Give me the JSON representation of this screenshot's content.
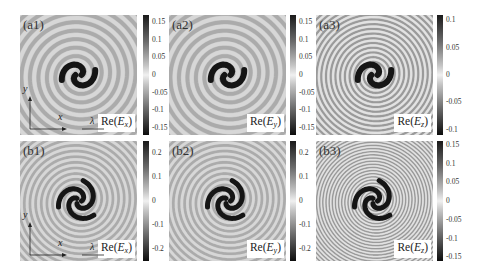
{
  "figure": {
    "panels": [
      {
        "id": "a1",
        "label": "(a1)",
        "quantity": "Re(",
        "field": "E",
        "component": "x",
        "close": ")",
        "row": 0,
        "col": 0,
        "arms": 2,
        "turns": 5,
        "contrast": 0.35,
        "colorbar": {
          "ticks": [
            "0.15",
            "0.1",
            "0.05",
            "0",
            "-0.05",
            "-0.1",
            "-0.15"
          ],
          "range": [
            -0.17,
            0.17
          ]
        }
      },
      {
        "id": "a2",
        "label": "(a2)",
        "quantity": "Re(",
        "field": "E",
        "component": "y",
        "close": ")",
        "row": 0,
        "col": 1,
        "arms": 2,
        "turns": 5,
        "contrast": 0.35,
        "colorbar": {
          "ticks": [
            "0.15",
            "0.1",
            "0.05",
            "0",
            "-0.05",
            "-0.1",
            "-0.15"
          ],
          "range": [
            -0.17,
            0.17
          ]
        }
      },
      {
        "id": "a3",
        "label": "(a3)",
        "quantity": "Re(",
        "field": "E",
        "component": "z",
        "close": ")",
        "row": 0,
        "col": 2,
        "arms": 2,
        "turns": 9,
        "contrast": 0.8,
        "colorbar": {
          "ticks": [
            "0.1",
            "0.05",
            "0",
            "-0.05",
            "-0.1"
          ],
          "range": [
            -0.11,
            0.11
          ]
        }
      },
      {
        "id": "b1",
        "label": "(b1)",
        "quantity": "Re(",
        "field": "E",
        "component": "x",
        "close": ")",
        "row": 1,
        "col": 0,
        "arms": 3,
        "turns": 5,
        "contrast": 0.35,
        "colorbar": {
          "ticks": [
            "0.2",
            "0.1",
            "0",
            "-0.1",
            "-0.2"
          ],
          "range": [
            -0.25,
            0.25
          ]
        }
      },
      {
        "id": "b2",
        "label": "(b2)",
        "quantity": "Re(",
        "field": "E",
        "component": "y",
        "close": ")",
        "row": 1,
        "col": 1,
        "arms": 3,
        "turns": 5,
        "contrast": 0.35,
        "colorbar": {
          "ticks": [
            "0.2",
            "0.1",
            "0",
            "-0.1",
            "-0.2"
          ],
          "range": [
            -0.25,
            0.25
          ]
        }
      },
      {
        "id": "b3",
        "label": "(b3)",
        "quantity": "Re(",
        "field": "E",
        "component": "z",
        "close": ")",
        "row": 1,
        "col": 2,
        "arms": 3,
        "turns": 9,
        "contrast": 0.8,
        "colorbar": {
          "ticks": [
            "0.15",
            "0.1",
            "0.05",
            "0",
            "-0.05",
            "-0.1",
            "-0.15"
          ],
          "range": [
            -0.16,
            0.16
          ]
        }
      }
    ],
    "axes_indicator": {
      "x_label": "x",
      "y_label": "y",
      "scale_label": "λ"
    },
    "colors": {
      "colormap_low": "#0d0d0d",
      "colormap_mid": "#f0f0f0",
      "colormap_high": "#1a1a1a",
      "background": "#c9c9c9"
    }
  }
}
